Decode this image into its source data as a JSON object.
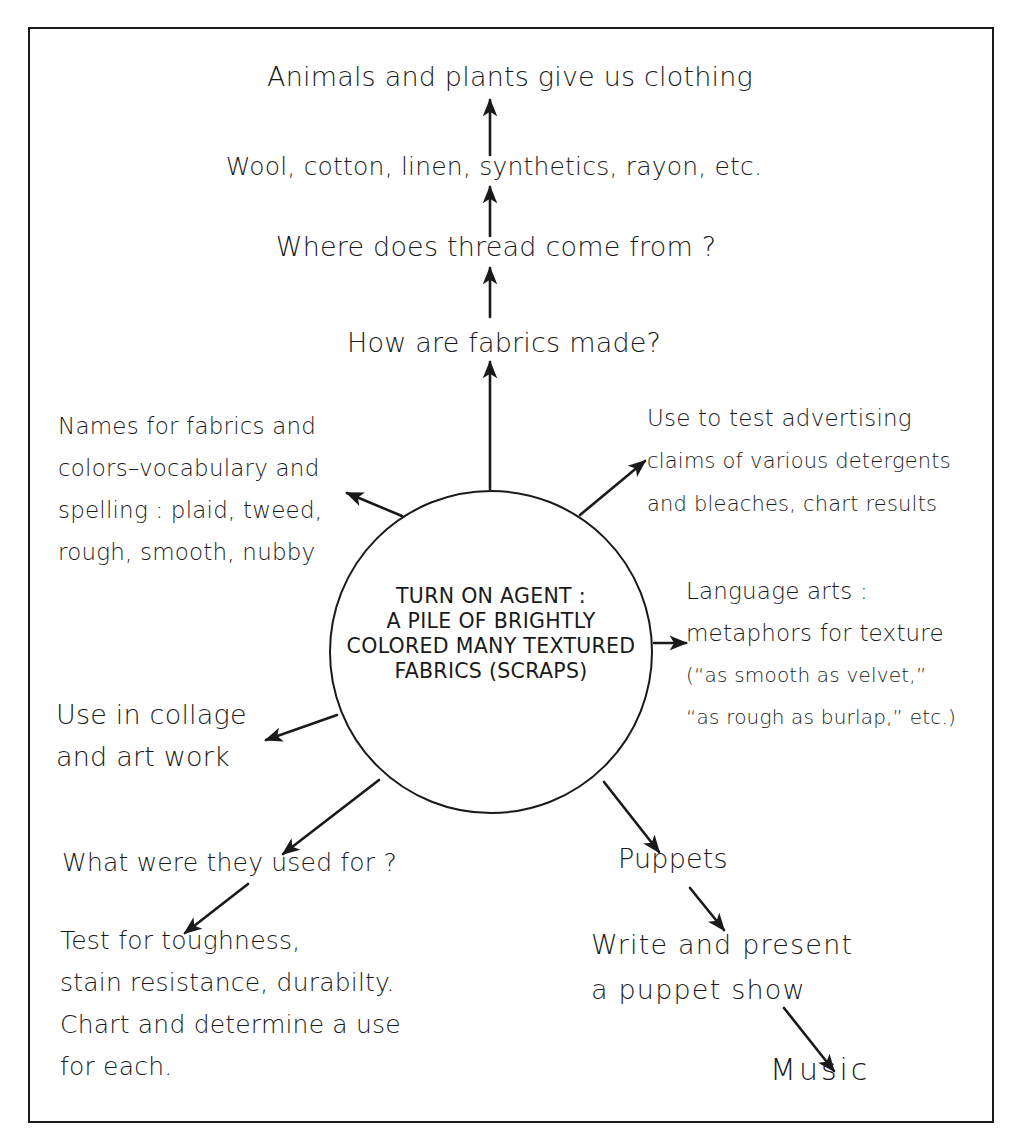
{
  "diagram": {
    "type": "web-diagram",
    "border_color": "#1a1a1a",
    "hub": {
      "lines": [
        "TURN ON AGENT :",
        "A PILE OF BRIGHTLY",
        "COLORED MANY TEXTURED",
        "FABRICS   (SCRAPS)"
      ]
    },
    "chain_up": [
      {
        "id": "how-made",
        "text": "How are fabrics made?"
      },
      {
        "id": "thread",
        "text": "Where does thread come from ?"
      },
      {
        "id": "materials",
        "text": "Wool, cotton, linen, synthetics, rayon, etc."
      },
      {
        "id": "animals-plants",
        "text": "Animals and plants give us clothing"
      }
    ],
    "vocabulary": {
      "lines": [
        "Names for fabrics and",
        "colors–vocabulary and",
        "spelling : plaid, tweed,",
        "rough, smooth, nubby"
      ]
    },
    "advertising": {
      "lines": [
        "Use to test advertising",
        "claims of various detergents",
        "and bleaches, chart results"
      ]
    },
    "language_arts": {
      "lines": [
        "Language arts :",
        "metaphors for texture",
        "(“as smooth as velvet,”",
        "“as rough as burlap,” etc.)"
      ]
    },
    "collage": {
      "lines": [
        "Use in collage",
        "and art work"
      ]
    },
    "used_for": {
      "text": "What were they used for ?"
    },
    "test": {
      "lines": [
        "Test for toughness,",
        "stain resistance, durabilty.",
        "Chart  and determine a use",
        "for each."
      ]
    },
    "puppets": {
      "text": "Puppets"
    },
    "puppet_show": {
      "lines": [
        "Write and present",
        "a puppet show"
      ]
    },
    "music": {
      "text": "Music"
    }
  }
}
